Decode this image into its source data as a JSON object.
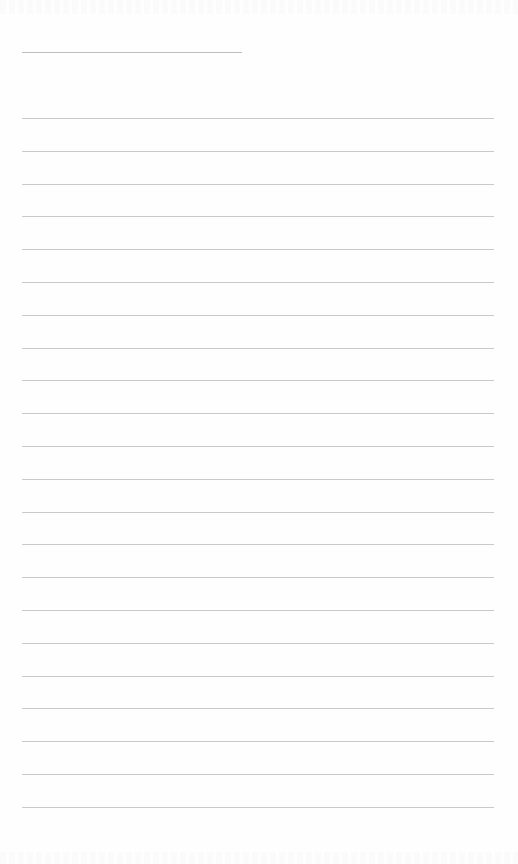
{
  "page": {
    "type": "ruled-paper",
    "background_color": "#fefefe",
    "line_color": "#c9c9c9",
    "header_line": {
      "left": 22,
      "right": 242,
      "y": 52
    },
    "body_lines": {
      "left": 22,
      "right": 494,
      "first_y": 118,
      "spacing": 32.8,
      "count": 22
    },
    "show_through_text": {
      "top": "",
      "bottom": ""
    }
  }
}
